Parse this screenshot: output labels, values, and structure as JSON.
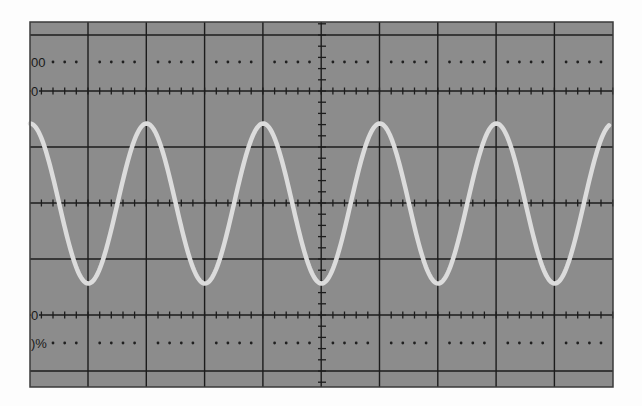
{
  "oscilloscope": {
    "screen": {
      "x": 30,
      "y": 22,
      "width": 583,
      "height": 365,
      "background": "#8c8c8c",
      "border": "#3a3a3a"
    },
    "grid": {
      "color": "#1c1c1c",
      "divisions_x": 10,
      "division_px_x": 58.3,
      "first_vertical_x": 88,
      "horizontal_lines_y": [
        35,
        91,
        147,
        203,
        259,
        315,
        371
      ],
      "center_x": 322,
      "center_y": 203,
      "minor_ticks_per_division": 5,
      "tick_lines_y": [
        91,
        203,
        315
      ],
      "dotted_rows_y": [
        62,
        343
      ]
    },
    "labels": [
      {
        "text": "00",
        "x": 31,
        "y": 67,
        "role": "100-percent-marker"
      },
      {
        "text": "0",
        "x": 31,
        "y": 96,
        "role": "top-reference-marker"
      },
      {
        "text": "0",
        "x": 31,
        "y": 320,
        "role": "bottom-reference-marker"
      },
      {
        "text": ")%",
        "x": 31,
        "y": 348,
        "role": "percent-marker"
      }
    ],
    "trace": {
      "type": "sine",
      "color": "#dcdcdc",
      "width": 4.5,
      "center_y": 203.5,
      "amplitude_px": 80,
      "period_px": 116.6,
      "first_peak_x": 30,
      "x_start": 30,
      "x_end": 609
    }
  }
}
